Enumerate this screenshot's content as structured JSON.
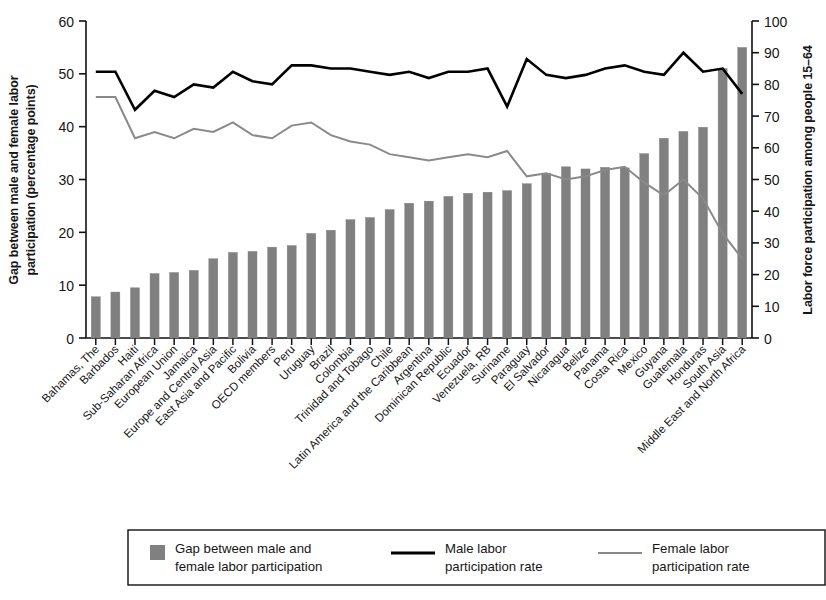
{
  "chart_data": {
    "type": "bar",
    "title": "",
    "subtitle": "",
    "ylabel": "Gap between male and female labor participation (percentage points)",
    "ylabel_right": "Labor force participation among people 15–64",
    "xlabel": "",
    "ylim": [
      0,
      60
    ],
    "yticks": [
      0,
      10,
      20,
      30,
      40,
      50,
      60
    ],
    "ylim_right": [
      0,
      100
    ],
    "yticks_right": [
      0,
      10,
      20,
      30,
      40,
      50,
      60,
      70,
      80,
      90,
      100
    ],
    "grid": false,
    "legend_position": "bottom",
    "bar_color": "#808080",
    "male_line_color": "#000000",
    "female_line_color": "#8a8a8a",
    "categories": [
      "Bahamas, The",
      "Barbados",
      "Haiti",
      "Sub-Saharan Africa",
      "European Union",
      "Jamaica",
      "Europe and Central Asia",
      "East Asia and Pacific",
      "Bolivia",
      "OECD members",
      "Peru",
      "Uruguay",
      "Brazil",
      "Colombia",
      "Trinidad and Tobago",
      "Chile",
      "Latin America and the Caribbean",
      "Argentina",
      "Dominican Republic",
      "Ecuador",
      "Venezuela, RB",
      "Suriname",
      "Paraguay",
      "El Salvador",
      "Nicaragua",
      "Belize",
      "Panama",
      "Costa Rica",
      "Mexico",
      "Guyana",
      "Guatemala",
      "Honduras",
      "South Asia",
      "Middle East and North Africa"
    ],
    "series": [
      {
        "name": "Gap between male and female labor participation",
        "type": "bar",
        "axis": "left",
        "values": [
          7.8,
          8.7,
          9.5,
          12.2,
          12.4,
          12.8,
          15.0,
          16.2,
          16.4,
          17.2,
          17.5,
          19.8,
          20.4,
          22.4,
          22.8,
          24.3,
          25.5,
          25.9,
          26.8,
          27.4,
          27.6,
          27.9,
          29.2,
          31.2,
          32.4,
          32.0,
          32.3,
          32.2,
          34.9,
          37.8,
          39.1,
          39.9,
          51.0,
          55.0
        ]
      },
      {
        "name": "Male labor participation rate",
        "type": "line",
        "axis": "right",
        "values": [
          84,
          84,
          72,
          78,
          76,
          80,
          79,
          84,
          81,
          80,
          86,
          86,
          85,
          85,
          84,
          83,
          84,
          82,
          84,
          84,
          85,
          73,
          88,
          83,
          82,
          83,
          85,
          86,
          84,
          83,
          90,
          84,
          85,
          77
        ]
      },
      {
        "name": "Female labor participation rate",
        "type": "line",
        "axis": "right",
        "values": [
          76,
          76,
          63,
          65,
          63,
          66,
          65,
          68,
          64,
          63,
          67,
          68,
          64,
          62,
          61,
          58,
          57,
          56,
          57,
          58,
          57,
          59,
          51,
          52,
          50,
          51,
          53,
          54,
          49,
          45,
          50,
          44,
          33,
          25
        ]
      }
    ]
  },
  "legend": {
    "items": [
      {
        "label_line1": "Gap between male and",
        "label_line2": "female labor participation",
        "marker": "swatch"
      },
      {
        "label_line1": "Male labor",
        "label_line2": "participation rate",
        "marker": "line-dark"
      },
      {
        "label_line1": "Female labor",
        "label_line2": "participation rate",
        "marker": "line-light"
      }
    ]
  }
}
